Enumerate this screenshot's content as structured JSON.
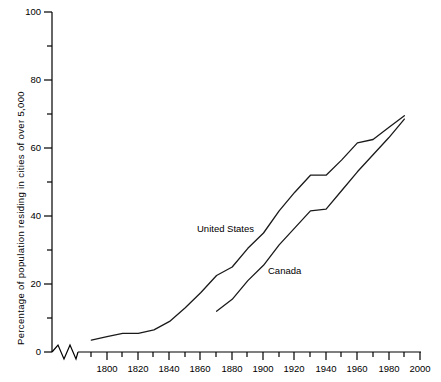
{
  "chart_data": {
    "type": "line",
    "title": "",
    "xlabel": "",
    "ylabel": "Percentage of population residing in cities of over 5,000",
    "xlim": [
      1780,
      2000
    ],
    "ylim": [
      0,
      100
    ],
    "grid": false,
    "legend_position": "inline-annotation",
    "x_ticks_major": [
      1800,
      1820,
      1840,
      1860,
      1880,
      1900,
      1920,
      1940,
      1960,
      1980,
      2000
    ],
    "x_ticks_minor": [
      1790,
      1810,
      1830,
      1850,
      1870,
      1890,
      1910,
      1930,
      1950,
      1970,
      1990
    ],
    "y_ticks_major": [
      0,
      20,
      40,
      60,
      80,
      100
    ],
    "y_ticks_minor": [
      10,
      30,
      50,
      70,
      90
    ],
    "axis_break": "zigzag-near-origin-on-x-axis",
    "series": [
      {
        "name": "United States",
        "label_x": 1890,
        "label_y": 28,
        "x": [
          1790,
          1800,
          1810,
          1820,
          1830,
          1840,
          1850,
          1860,
          1870,
          1880,
          1890,
          1900,
          1910,
          1920,
          1930,
          1940,
          1950,
          1960,
          1970,
          1980,
          1990
        ],
        "values": [
          3.5,
          4.5,
          5.5,
          5.5,
          6.5,
          9,
          13,
          17.5,
          22.5,
          25,
          30.5,
          35,
          41.5,
          47,
          52,
          52,
          56.5,
          61.5,
          62.5,
          66,
          69.5
        ]
      },
      {
        "name": "Canada",
        "label_x": 1908,
        "label_y": 22,
        "x": [
          1870,
          1880,
          1890,
          1900,
          1910,
          1920,
          1930,
          1940,
          1950,
          1960,
          1970,
          1980,
          1990
        ],
        "values": [
          12,
          15.5,
          21,
          25.5,
          31.5,
          36.5,
          41.5,
          42,
          47.5,
          53,
          58,
          63,
          68.5
        ]
      }
    ]
  },
  "axis": {
    "y_title": "Percentage of population residing in cities of over 5,000",
    "y_tick_0": "0",
    "y_tick_20": "20",
    "y_tick_40": "40",
    "y_tick_60": "60",
    "y_tick_80": "80",
    "y_tick_100": "100",
    "x_tick_1800": "1800",
    "x_tick_1820": "1820",
    "x_tick_1840": "1840",
    "x_tick_1860": "1860",
    "x_tick_1880": "1880",
    "x_tick_1900": "1900",
    "x_tick_1920": "1920",
    "x_tick_1940": "1940",
    "x_tick_1960": "1960",
    "x_tick_1980": "1980",
    "x_tick_2000": "2000"
  },
  "annotations": {
    "united_states": "United   States",
    "canada": "Canada"
  },
  "colors": {
    "axis": "#000000",
    "line": "#1a1a1a",
    "background": "#ffffff"
  }
}
